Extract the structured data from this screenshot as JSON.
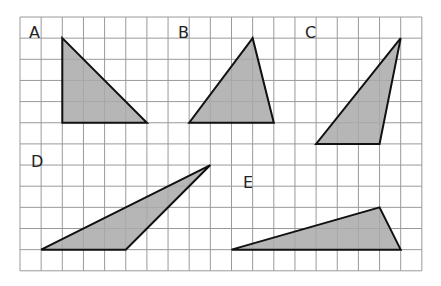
{
  "grid": {
    "origin_x": 20,
    "origin_y": 17,
    "cell": 21.15,
    "cols": 19,
    "rows": 12,
    "line_color": "#9a9a9a",
    "background": "#ffffff"
  },
  "style": {
    "fill": "#a9a9a9",
    "stroke": "#111111"
  },
  "triangles": [
    {
      "label": "A",
      "vertices": [
        [
          2,
          1
        ],
        [
          2,
          5
        ],
        [
          6,
          5
        ]
      ],
      "label_pos": [
        29,
        38
      ]
    },
    {
      "label": "B",
      "vertices": [
        [
          11,
          1
        ],
        [
          8,
          5
        ],
        [
          12,
          5
        ]
      ],
      "label_pos": [
        178,
        38
      ]
    },
    {
      "label": "C",
      "vertices": [
        [
          18,
          1
        ],
        [
          14,
          6
        ],
        [
          17,
          6
        ]
      ],
      "label_pos": [
        305,
        38
      ]
    },
    {
      "label": "D",
      "vertices": [
        [
          1,
          11
        ],
        [
          5,
          11
        ],
        [
          9,
          7
        ]
      ],
      "label_pos": [
        31,
        167
      ]
    },
    {
      "label": "E",
      "vertices": [
        [
          10,
          11
        ],
        [
          17,
          9
        ],
        [
          18,
          11
        ]
      ],
      "label_pos": [
        243,
        188
      ]
    }
  ]
}
